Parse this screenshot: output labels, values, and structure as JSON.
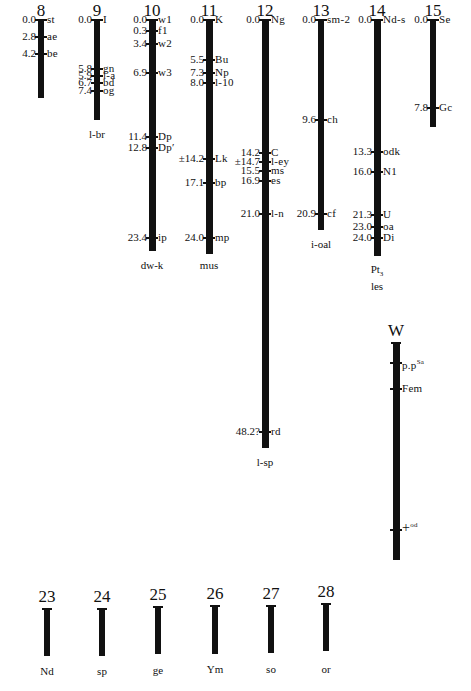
{
  "linkage_groups": [
    {
      "id": "8",
      "label": "8",
      "loci": [
        {
          "pos": "0.0",
          "gene": "st",
          "v": 0.0
        },
        {
          "pos": "2.8",
          "gene": "ae",
          "v": 2.8
        },
        {
          "pos": "4.2",
          "gene": "be",
          "v": 4.2
        }
      ],
      "footer": ""
    },
    {
      "id": "9",
      "label": "9",
      "loci": [
        {
          "pos": "0.0",
          "gene": "I",
          "v": 0.0
        },
        {
          "pos": "5.8",
          "gene": "gn",
          "v": 5.8
        },
        {
          "pos": "5.9",
          "gene": "l-a",
          "v": 5.9
        },
        {
          "pos": "6.7",
          "gene": "bd",
          "v": 6.7
        },
        {
          "pos": "7.4",
          "gene": "og",
          "v": 7.4
        }
      ],
      "footer": "l-br"
    },
    {
      "id": "10",
      "label": "10",
      "loci": [
        {
          "pos": "0.0",
          "gene": "w1",
          "v": 0.0
        },
        {
          "pos": "0.3",
          "gene": "f1",
          "v": 0.3
        },
        {
          "pos": "3.4",
          "gene": "w2",
          "v": 3.4
        },
        {
          "pos": "6.9",
          "gene": "w3",
          "v": 6.9
        },
        {
          "pos": "11.4",
          "gene": "Dp",
          "v": 11.4
        },
        {
          "pos": "12.8",
          "gene": "Dp′",
          "v": 12.8
        },
        {
          "pos": "23.4",
          "gene": "ip",
          "v": 23.4
        }
      ],
      "footer": "dw-k"
    },
    {
      "id": "11",
      "label": "11",
      "loci": [
        {
          "pos": "0.0",
          "gene": "K",
          "v": 0.0
        },
        {
          "pos": "5.5",
          "gene": "Bu",
          "v": 5.5
        },
        {
          "pos": "7.3",
          "gene": "Np",
          "v": 7.3
        },
        {
          "pos": "8.0",
          "gene": "l-10",
          "v": 8.0
        },
        {
          "pos": "±14.2",
          "gene": "Lk",
          "v": 14.2
        },
        {
          "pos": "17.1",
          "gene": "bp",
          "v": 17.1
        },
        {
          "pos": "24.0",
          "gene": "mp",
          "v": 24.0
        }
      ],
      "footer": "mus"
    },
    {
      "id": "12",
      "label": "12",
      "loci": [
        {
          "pos": "0.0",
          "gene": "Ng",
          "v": 0.0
        },
        {
          "pos": "14.2",
          "gene": "C",
          "v": 14.2
        },
        {
          "pos": "±14.7",
          "gene": "l-ey",
          "v": 14.7
        },
        {
          "pos": "15.5",
          "gene": "ms",
          "v": 15.5
        },
        {
          "pos": "16.9",
          "gene": "es",
          "v": 16.9
        },
        {
          "pos": "21.0",
          "gene": "l-n",
          "v": 21.0
        },
        {
          "pos": "48.2?",
          "gene": "rd",
          "v": 48.2
        }
      ],
      "footer": "l-sp"
    },
    {
      "id": "13",
      "label": "13",
      "loci": [
        {
          "pos": "0.0",
          "gene": "sm-2",
          "v": 0.0
        },
        {
          "pos": "9.6",
          "gene": "ch",
          "v": 9.6
        },
        {
          "pos": "20.9",
          "gene": "cf",
          "v": 20.9
        }
      ],
      "footer": "i-oal"
    },
    {
      "id": "14",
      "label": "14",
      "loci": [
        {
          "pos": "0.0",
          "gene": "Nd-s",
          "v": 0.0
        },
        {
          "pos": "13.3",
          "gene": "odk",
          "v": 13.3
        },
        {
          "pos": "16.0",
          "gene": "N1",
          "v": 16.0
        },
        {
          "pos": "21.3",
          "gene": "U",
          "v": 21.3
        },
        {
          "pos": "23.0",
          "gene": "oa",
          "v": 23.0
        },
        {
          "pos": "24.0",
          "gene": "Di",
          "v": 24.0
        }
      ],
      "footer": "Pt3 les"
    },
    {
      "id": "15",
      "label": "15",
      "loci": [
        {
          "pos": "0.0",
          "gene": "Se",
          "v": 0.0
        },
        {
          "pos": "7.8",
          "gene": "Gc",
          "v": 7.8
        }
      ],
      "footer": ""
    },
    {
      "id": "W",
      "label": "W",
      "loci": [
        {
          "pos": "",
          "gene": "p.pSa",
          "v": null
        },
        {
          "pos": "",
          "gene": "Fem",
          "v": null
        },
        {
          "pos": "",
          "gene": "+od",
          "v": null
        }
      ],
      "footer": ""
    },
    {
      "id": "23",
      "label": "23",
      "loci": [],
      "footer": "Nd"
    },
    {
      "id": "24",
      "label": "24",
      "loci": [],
      "footer": "sp"
    },
    {
      "id": "25",
      "label": "25",
      "loci": [],
      "footer": "ge"
    },
    {
      "id": "26",
      "label": "26",
      "loci": [],
      "footer": "Ym"
    },
    {
      "id": "27",
      "label": "27",
      "loci": [],
      "footer": "so"
    },
    {
      "id": "28",
      "label": "28",
      "loci": [],
      "footer": "or"
    }
  ]
}
